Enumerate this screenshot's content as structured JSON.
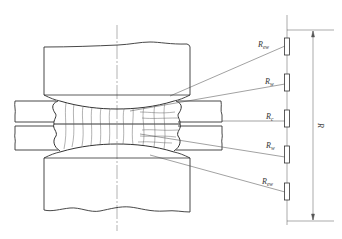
{
  "figure": {
    "colors": {
      "line": "#333333",
      "thin_line": "#555555",
      "background": "#ffffff"
    }
  },
  "resistors": [
    {
      "id": "R_ew_top",
      "symbol": "R",
      "subscript": "ew"
    },
    {
      "id": "R_w_top",
      "symbol": "R",
      "subscript": "w"
    },
    {
      "id": "R_c",
      "symbol": "R",
      "subscript": "c"
    },
    {
      "id": "R_w_bottom",
      "symbol": "R",
      "subscript": "w"
    },
    {
      "id": "R_ew_bottom",
      "symbol": "R",
      "subscript": "ew"
    }
  ],
  "dimension": {
    "label": "R"
  }
}
